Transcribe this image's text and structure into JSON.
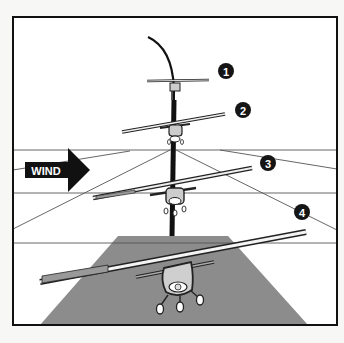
{
  "diagram": {
    "wind_label": "WIND",
    "steps": [
      {
        "label": "1"
      },
      {
        "label": "2"
      },
      {
        "label": "3"
      },
      {
        "label": "4"
      }
    ],
    "colors": {
      "background": "#ffffff",
      "frame": "#111111",
      "runway": "#8c8c8c",
      "arrow": "#111111",
      "badge": "#151515",
      "badge_text": "#ffffff"
    }
  }
}
